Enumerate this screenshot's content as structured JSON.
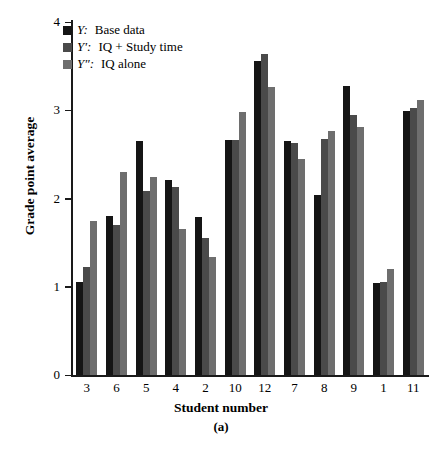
{
  "chart_data": {
    "type": "bar",
    "title": "",
    "panel_label": "(a)",
    "xlabel": "Student number",
    "ylabel": "Grade point average",
    "categories": [
      "3",
      "6",
      "5",
      "4",
      "2",
      "10",
      "12",
      "7",
      "8",
      "9",
      "1",
      "11"
    ],
    "ylim": [
      0,
      4
    ],
    "yticks": [
      0,
      1,
      2,
      3,
      4
    ],
    "grid": false,
    "legend_position": "top-left",
    "series": [
      {
        "name": "Y:  Base data",
        "symbol": "Y",
        "label": "Base data",
        "color": "#151515",
        "values": [
          1.05,
          1.8,
          2.65,
          2.21,
          1.79,
          2.66,
          3.56,
          2.65,
          2.04,
          3.27,
          1.04,
          2.99
        ]
      },
      {
        "name": "Y′:  IQ + Study time",
        "symbol": "Y′",
        "label": "IQ + Study time",
        "color": "#4a4a4a",
        "values": [
          1.22,
          1.7,
          2.08,
          2.13,
          1.55,
          2.66,
          3.64,
          2.63,
          2.67,
          2.95,
          1.05,
          3.03
        ]
      },
      {
        "name": "Y″:  IQ alone",
        "symbol": "Y″",
        "label": "IQ alone",
        "color": "#6e6e6e",
        "values": [
          1.74,
          2.3,
          2.24,
          1.66,
          1.34,
          2.98,
          3.26,
          2.45,
          2.77,
          2.81,
          1.2,
          3.12
        ]
      }
    ]
  },
  "axes": {
    "y_tick_labels": [
      "0",
      "1",
      "2",
      "3",
      "4"
    ],
    "x_tick_labels": [
      "3",
      "6",
      "5",
      "4",
      "2",
      "10",
      "12",
      "7",
      "8",
      "9",
      "1",
      "11"
    ]
  }
}
